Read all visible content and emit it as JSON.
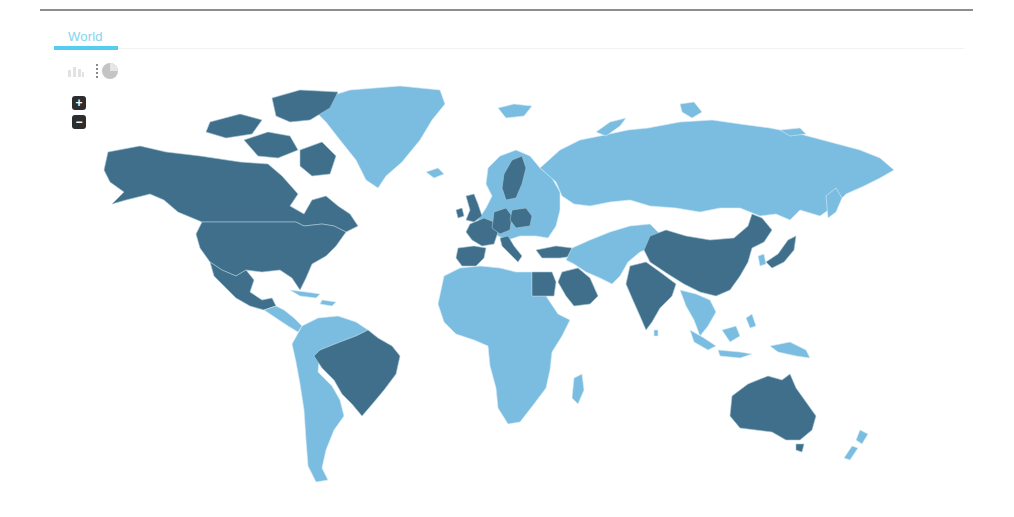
{
  "tabs": [
    {
      "label": "World",
      "active": true
    }
  ],
  "toolbar": {
    "chart_types": [
      {
        "name": "bar-chart",
        "icon": "bar-chart-icon",
        "active": false
      },
      {
        "name": "pie-chart",
        "icon": "pie-chart-icon",
        "active": false
      }
    ]
  },
  "zoom_controls": {
    "zoom_in_label": "+",
    "zoom_out_label": "−"
  },
  "map": {
    "type": "choropleth",
    "region": "World",
    "colors": {
      "highlighted": "#3f6f8a",
      "default": "#7bbde0",
      "border": "#d6ecf7",
      "background": "#ffffff"
    },
    "highlighted_countries": [
      "Canada",
      "United States",
      "Mexico",
      "Brazil",
      "United Kingdom",
      "France",
      "Spain",
      "Germany",
      "Poland",
      "Italy",
      "Sweden",
      "Turkey",
      "Egypt",
      "Saudi Arabia",
      "India",
      "China",
      "Japan",
      "Australia"
    ],
    "default_regions": [
      "Greenland",
      "Russia",
      "Central America",
      "South America (other)",
      "Africa (other)",
      "Middle East (other)",
      "Central Asia",
      "Southeast Asia",
      "Indonesia",
      "New Zealand",
      "Europe (other)"
    ]
  }
}
